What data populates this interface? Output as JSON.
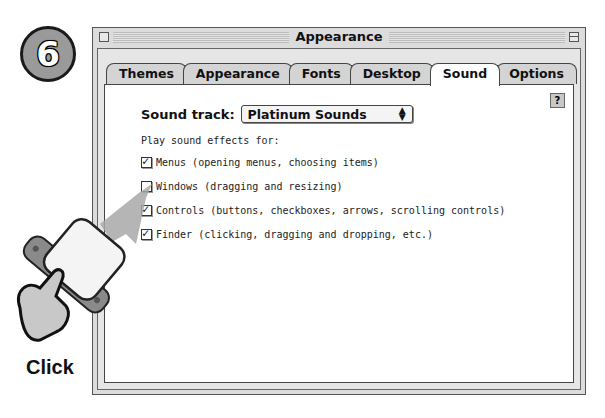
{
  "step": {
    "number": "6"
  },
  "window": {
    "title": "Appearance",
    "tabs": [
      {
        "label": "Themes",
        "active": false
      },
      {
        "label": "Appearance",
        "active": false
      },
      {
        "label": "Fonts",
        "active": false
      },
      {
        "label": "Desktop",
        "active": false
      },
      {
        "label": "Sound",
        "active": true
      },
      {
        "label": "Options",
        "active": false
      }
    ],
    "help_glyph": "?"
  },
  "sound": {
    "track_label": "Sound track:",
    "track_value": "Platinum Sounds",
    "subheading": "Play sound effects for:",
    "options": [
      {
        "label": "Menus (opening menus, choosing items)",
        "checked": true
      },
      {
        "label": "Windows (dragging and resizing)",
        "checked": false
      },
      {
        "label": "Controls (buttons, checkboxes, arrows, scrolling controls)",
        "checked": true
      },
      {
        "label": "Finder (clicking, dragging and dropping, etc.)",
        "checked": true
      }
    ]
  },
  "callout": {
    "action_label": "Click"
  }
}
